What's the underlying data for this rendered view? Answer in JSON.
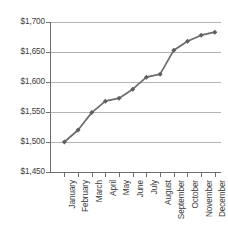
{
  "chart_data": {
    "type": "line",
    "title": "",
    "xlabel": "",
    "ylabel": "",
    "categories": [
      "January",
      "February",
      "March",
      "April",
      "May",
      "June",
      "July",
      "August",
      "September",
      "October",
      "November",
      "December"
    ],
    "values": [
      1500,
      1520,
      1549,
      1568,
      1573,
      1588,
      1608,
      1613,
      1653,
      1668,
      1678,
      1683
    ],
    "series": [
      {
        "name": "",
        "values": [
          1500,
          1520,
          1549,
          1568,
          1573,
          1588,
          1608,
          1613,
          1653,
          1668,
          1678,
          1683
        ]
      }
    ],
    "ylim": [
      1450,
      1700
    ],
    "ytick_values": [
      1450,
      1500,
      1550,
      1600,
      1650,
      1700
    ],
    "ytick_labels": [
      "$1,450",
      "$1,500",
      "$1,550",
      "$1,600",
      "$1,650",
      "$1,700"
    ],
    "grid": true,
    "legend": false,
    "legend_position": "none",
    "line_color": "#6b6b6b",
    "marker_color": "#5f5f5f",
    "grid_color": "#b4b4b4",
    "axis_color": "#6e6e6e",
    "text_color": "#3a3a3a",
    "background_color": "#ffffff",
    "marker": "diamond"
  }
}
